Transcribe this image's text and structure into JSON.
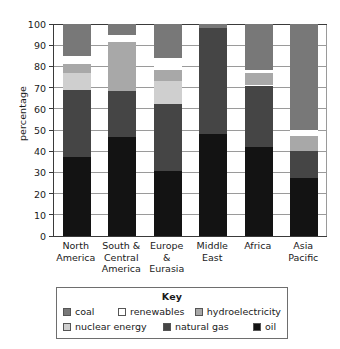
{
  "chart_data": {
    "type": "bar",
    "title": "",
    "subtitle": "",
    "xlabel": "",
    "ylabel": "percentage",
    "ylim": [
      0,
      100
    ],
    "y_ticks": [
      0,
      10,
      20,
      30,
      40,
      50,
      60,
      70,
      80,
      90,
      100
    ],
    "grid": true,
    "stacked": true,
    "legend_position": "bottom",
    "legend_title": "Key",
    "categories": [
      "North America",
      "South & Central America",
      "Europe & Eurasia",
      "Middle East",
      "Africa",
      "Asia Pacific"
    ],
    "category_lines": [
      [
        "North",
        "America"
      ],
      [
        "South &",
        "Central",
        "America"
      ],
      [
        "Europe",
        "&",
        "Eurasia"
      ],
      [
        "Middle",
        "East"
      ],
      [
        "Africa"
      ],
      [
        "Asia",
        "Pacific"
      ]
    ],
    "series": [
      {
        "name": "oil",
        "color": "#131313",
        "values": [
          37.5,
          46.5,
          30.5,
          48.0,
          42.0,
          27.5
        ]
      },
      {
        "name": "natural gas",
        "color": "#454545",
        "values": [
          31.5,
          22.0,
          32.0,
          50.0,
          29.0,
          12.5
        ]
      },
      {
        "name": "nuclear energy",
        "color": "#cfcfcf",
        "values": [
          8.0,
          0.0,
          10.5,
          0.0,
          0.0,
          0.0
        ]
      },
      {
        "name": "hydroelectricity",
        "color": "#a8a8a8",
        "values": [
          4.0,
          23.0,
          5.5,
          0.0,
          6.0,
          7.0
        ]
      },
      {
        "name": "renewables",
        "color": "#ffffff",
        "values": [
          4.0,
          3.5,
          5.5,
          0.0,
          1.5,
          3.0
        ]
      },
      {
        "name": "coal",
        "color": "#787878",
        "values": [
          15.0,
          5.0,
          16.0,
          2.0,
          21.5,
          50.0
        ]
      }
    ]
  },
  "legend": {
    "title": "Key",
    "row1": [
      {
        "label": "coal",
        "color": "#787878"
      },
      {
        "label": "renewables",
        "color": "#ffffff"
      },
      {
        "label": "hydroelectricity",
        "color": "#a8a8a8"
      }
    ],
    "row2": [
      {
        "label": "nuclear energy",
        "color": "#cfcfcf"
      },
      {
        "label": "natural gas",
        "color": "#454545"
      },
      {
        "label": "oil",
        "color": "#131313"
      }
    ]
  }
}
